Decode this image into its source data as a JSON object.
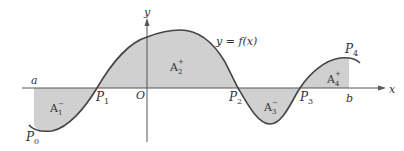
{
  "diagram": {
    "title": "",
    "curve_label": "y = f(x)",
    "axes": {
      "x_label": "x",
      "y_label": "y",
      "origin_label": "O"
    },
    "bounds": {
      "a": "a",
      "b": "b"
    },
    "points": [
      {
        "name": "P",
        "sub": "0"
      },
      {
        "name": "P",
        "sub": "1"
      },
      {
        "name": "P",
        "sub": "2"
      },
      {
        "name": "P",
        "sub": "3"
      },
      {
        "name": "P",
        "sub": "4"
      }
    ],
    "areas": [
      {
        "name": "A",
        "sub": "1",
        "sign": "−"
      },
      {
        "name": "A",
        "sub": "2",
        "sign": "+"
      },
      {
        "name": "A",
        "sub": "3",
        "sign": "−"
      },
      {
        "name": "A",
        "sub": "4",
        "sign": "+"
      }
    ],
    "colors": {
      "fill": "#d0d0d0",
      "curve": "#444444",
      "axis": "#555555"
    }
  }
}
